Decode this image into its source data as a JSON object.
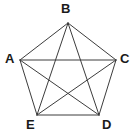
{
  "figure": {
    "name": "pentagon-with-diagonals",
    "type": "geometry-diagram",
    "width": 134,
    "height": 133,
    "background_color": "#ffffff",
    "line_color": "#3c3c3c",
    "line_width": 1,
    "label_color": "#1a1a1a"
  },
  "vertices": [
    {
      "id": "A",
      "label": "A",
      "x": 20,
      "y": 60,
      "label_x": 5,
      "label_y": 52
    },
    {
      "id": "B",
      "label": "B",
      "x": 68,
      "y": 23,
      "label_x": 61,
      "label_y": 2
    },
    {
      "id": "C",
      "label": "C",
      "x": 116,
      "y": 60,
      "label_x": 120,
      "label_y": 52
    },
    {
      "id": "D",
      "label": "D",
      "x": 99,
      "y": 115,
      "label_x": 102,
      "label_y": 118
    },
    {
      "id": "E",
      "label": "E",
      "x": 37,
      "y": 115,
      "label_x": 26,
      "label_y": 118
    }
  ],
  "edges": [
    {
      "name": "side-A-B",
      "from": "A",
      "to": "B",
      "kind": "side"
    },
    {
      "name": "side-B-C",
      "from": "B",
      "to": "C",
      "kind": "side"
    },
    {
      "name": "side-C-D",
      "from": "C",
      "to": "D",
      "kind": "side"
    },
    {
      "name": "side-D-E",
      "from": "D",
      "to": "E",
      "kind": "side"
    },
    {
      "name": "side-E-A",
      "from": "E",
      "to": "A",
      "kind": "side"
    },
    {
      "name": "diagonal-A-C",
      "from": "A",
      "to": "C",
      "kind": "diagonal"
    },
    {
      "name": "diagonal-A-D",
      "from": "A",
      "to": "D",
      "kind": "diagonal"
    },
    {
      "name": "diagonal-B-D",
      "from": "B",
      "to": "D",
      "kind": "diagonal"
    },
    {
      "name": "diagonal-B-E",
      "from": "B",
      "to": "E",
      "kind": "diagonal"
    },
    {
      "name": "diagonal-C-E",
      "from": "C",
      "to": "E",
      "kind": "diagonal"
    }
  ]
}
